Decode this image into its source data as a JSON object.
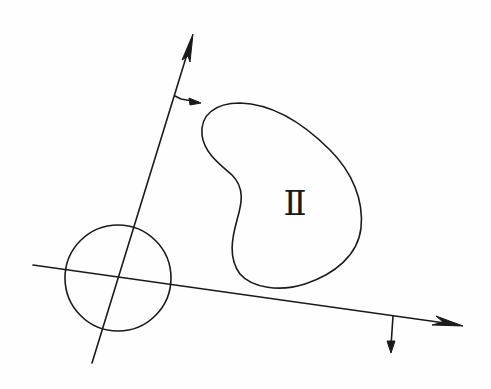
{
  "diagram": {
    "background": "#fefefe",
    "stroke_color": "#1a1a1a",
    "region_label": "Ⅱ",
    "elements": {
      "axis_1": {
        "from": [
          92,
          363
        ],
        "to": [
          193,
          34
        ],
        "arrow": "end"
      },
      "axis_1_normal_arrow": {
        "from": [
          175,
          96
        ],
        "to": [
          201,
          103
        ]
      },
      "axis_2": {
        "from": [
          33,
          265
        ],
        "to": [
          463,
          326
        ],
        "arrow": "end"
      },
      "axis_2_normal_arrow": {
        "from": [
          393,
          316
        ],
        "to": [
          391,
          353
        ]
      },
      "circle": {
        "cx": 118,
        "cy": 278,
        "r": 53
      },
      "region_ii": {
        "label": "Ⅱ",
        "label_pos": [
          295,
          215
        ]
      }
    }
  }
}
